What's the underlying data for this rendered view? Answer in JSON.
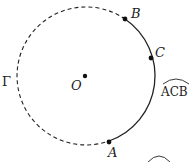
{
  "diagram": {
    "circle_label": "Γ",
    "center_label": "O",
    "points": [
      {
        "name": "A",
        "label": "A"
      },
      {
        "name": "B",
        "label": "B"
      },
      {
        "name": "C",
        "label": "C"
      }
    ],
    "arc_label": "ACB",
    "arc_style": {
      "solid": "arc from A through C to B",
      "dashed": "remaining arc"
    },
    "colors": {
      "stroke": "#222222",
      "background": "#ffffff"
    }
  }
}
